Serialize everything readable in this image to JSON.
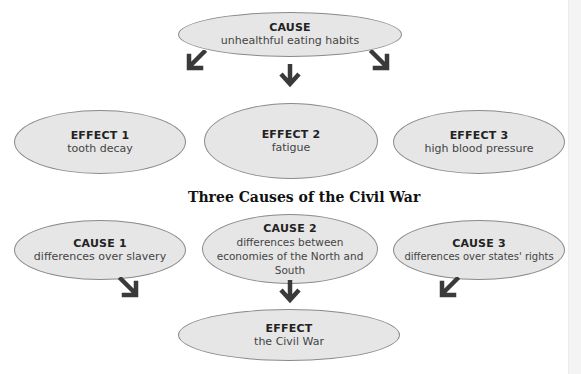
{
  "diagram1": {
    "cause": {
      "label": "CAUSE",
      "text": "unhealthful eating habits"
    },
    "effects": [
      {
        "label": "EFFECT 1",
        "text": "tooth decay"
      },
      {
        "label": "EFFECT 2",
        "text": "fatigue"
      },
      {
        "label": "EFFECT 3",
        "text": "high blood pressure"
      }
    ]
  },
  "diagram2": {
    "title": "Three Causes of the Civil War",
    "causes": [
      {
        "label": "CAUSE 1",
        "text": "differences over slavery"
      },
      {
        "label": "CAUSE 2",
        "text": "differences between economies of the North and South"
      },
      {
        "label": "CAUSE 3",
        "text": "differences over states' rights"
      }
    ],
    "effect": {
      "label": "EFFECT",
      "text": "the Civil War"
    }
  },
  "colors": {
    "oval_fill": "#e6e6e6",
    "oval_border": "#8a8a8a",
    "arrow": "#3a3a3a"
  }
}
